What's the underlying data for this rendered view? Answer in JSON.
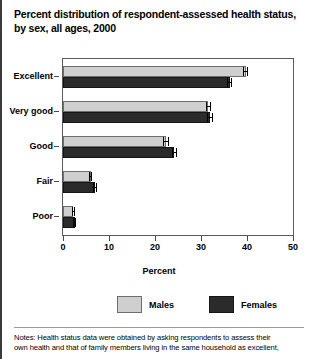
{
  "title": {
    "line1": "Percent distribution of respondent-assessed health status,",
    "line2": "by sex, all ages, 2000"
  },
  "chart_data": {
    "type": "bar",
    "orientation": "horizontal",
    "title": "Percent distribution of respondent-assessed health status, by sex, all ages, 2000",
    "xlabel": "Percent",
    "ylabel": "",
    "xlim": [
      0,
      50
    ],
    "xticks": [
      0,
      10,
      20,
      30,
      40,
      50
    ],
    "xtick_labels": [
      "0",
      "10",
      "20",
      "30",
      "40",
      "50"
    ],
    "grid": false,
    "legend_position": "bottom",
    "categories": [
      "Excellent",
      "Very good",
      "Good",
      "Fair",
      "Poor"
    ],
    "series": [
      {
        "name": "Males",
        "color": "#cfcfcf",
        "values": [
          39.7,
          31.6,
          22.4,
          6.0,
          2.2
        ],
        "errors": [
          0.6,
          0.6,
          0.6,
          0.4,
          0.3
        ]
      },
      {
        "name": "Females",
        "color": "#2b2b2b",
        "values": [
          36.2,
          32.0,
          24.2,
          7.0,
          2.5
        ],
        "errors": [
          0.6,
          0.6,
          0.6,
          0.4,
          0.3
        ]
      }
    ]
  },
  "axis": {
    "x_title": "Percent"
  },
  "legend": {
    "males_label": "Males",
    "females_label": "Females"
  },
  "footnote": {
    "line1": "Notes: Health status data were obtained by asking respondents to assess their",
    "line2": "own health and that of family members living in the same household as excellent,"
  }
}
